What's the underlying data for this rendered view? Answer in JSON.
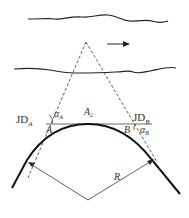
{
  "diagram": {
    "labels": {
      "jd_a": "JD",
      "jd_a_sub": "A",
      "jd_b": "JD",
      "jd_b_sub": "B",
      "alpha_a": "α",
      "alpha_a_sub": "A",
      "alpha_b": "α",
      "alpha_b_sub": "B",
      "point_a": "A",
      "point_b": "B",
      "apex": "A",
      "apex_sub": "2",
      "radius": "R"
    },
    "flow_direction": "right",
    "caption": "图 ... 示意"
  }
}
